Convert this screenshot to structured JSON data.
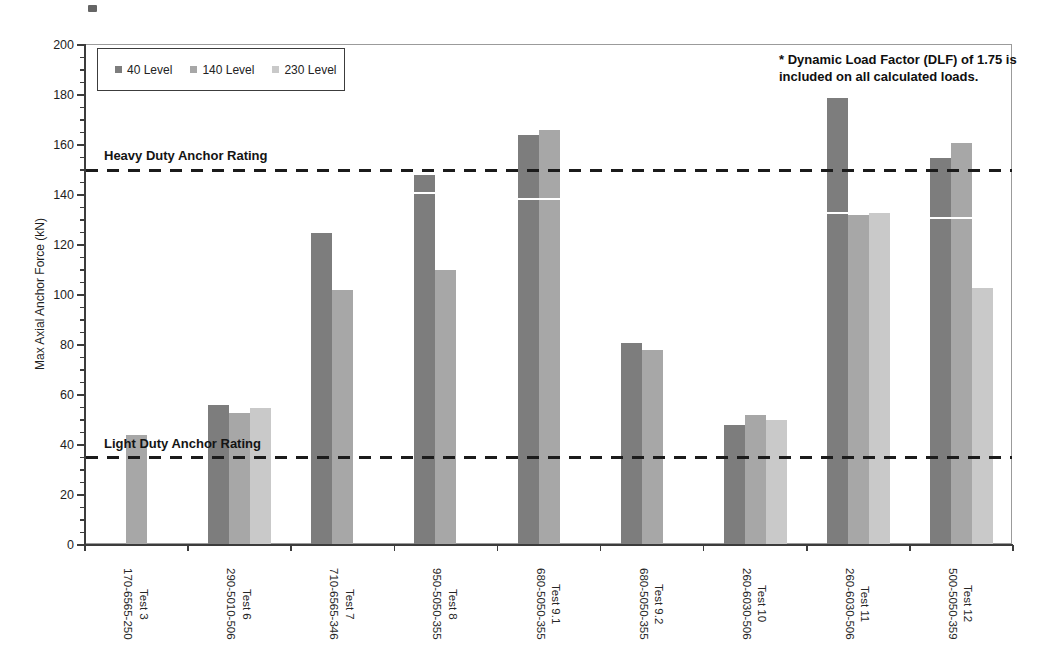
{
  "chart_data": {
    "type": "bar",
    "title": "",
    "ylabel": "Max Axial Anchor Force (kN)",
    "ylim": [
      0,
      200
    ],
    "ytick_major": 20,
    "ytick_minor": 5,
    "yticks": [
      0,
      20,
      40,
      60,
      80,
      100,
      120,
      140,
      160,
      180,
      200
    ],
    "legend_position": "top-left",
    "grid": false,
    "legend": [
      {
        "label": "40 Level",
        "color": "#7d7d7d"
      },
      {
        "label": "140 Level",
        "color": "#a7a7a7"
      },
      {
        "label": "230 Level",
        "color": "#c9c9c9"
      }
    ],
    "reference_lines": [
      {
        "label": "Heavy Duty Anchor Rating",
        "value": 150
      },
      {
        "label": "Light Duty Anchor Rating",
        "value": 35
      }
    ],
    "annotation": {
      "line1": "* Dynamic Load Factor (DLF) of 1.75 is",
      "line2": "included on all calculated loads."
    },
    "categories": [
      {
        "test": "Test 3",
        "code": "170-6565-250",
        "values": [
          null,
          44,
          null
        ]
      },
      {
        "test": "Test 6",
        "code": "290-5010-506",
        "values": [
          56,
          53,
          55
        ]
      },
      {
        "test": "Test 7",
        "code": "710-6565-346",
        "values": [
          125,
          102,
          null
        ]
      },
      {
        "test": "Test 8",
        "code": "950-5050-355",
        "values": [
          148,
          110,
          null
        ],
        "white_line": {
          "value": 141,
          "bars": [
            0
          ]
        }
      },
      {
        "test": "Test 9.1",
        "code": "680-5050-355",
        "values": [
          164,
          166,
          null
        ],
        "white_line": {
          "value": 138.5,
          "bars": [
            0,
            1
          ]
        }
      },
      {
        "test": "Test 9.2",
        "code": "680-5050-355",
        "values": [
          81,
          78,
          null
        ]
      },
      {
        "test": "Test 10",
        "code": "260-6030-506",
        "values": [
          48,
          52,
          50
        ]
      },
      {
        "test": "Test 11",
        "code": "260-6030-506",
        "values": [
          179,
          132,
          133
        ],
        "white_line": {
          "value": 133,
          "bars": [
            0
          ]
        }
      },
      {
        "test": "Test 12",
        "code": "500-5050-359",
        "values": [
          155,
          161,
          103
        ],
        "white_line": {
          "value": 131,
          "bars": [
            0,
            1
          ]
        }
      }
    ],
    "colors": {
      "axis": "#3c3c3c",
      "plot_border": "#9b9b9b",
      "reference_line": "#1b1b1b",
      "background": "#ffffff"
    }
  }
}
